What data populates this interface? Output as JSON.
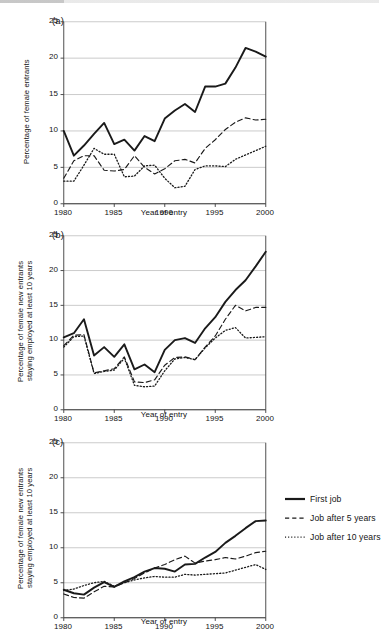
{
  "figure": {
    "panels": [
      {
        "tag": "(a)",
        "ylabel": "Percentage of female entrants",
        "xlabel": "Year of entry",
        "yticks": [
          "0",
          "5",
          "10",
          "15",
          "20",
          "25"
        ],
        "xticks": [
          "1980",
          "1985",
          "1990",
          "1995",
          "2000"
        ]
      },
      {
        "tag": "(b)",
        "ylabel": "Percentage of female new entrants\nstaying employed at least 10 years",
        "xlabel": "Year of entry",
        "yticks": [
          "0",
          "5",
          "10",
          "15",
          "20",
          "25"
        ],
        "xticks": [
          "1980",
          "1985",
          "1990",
          "1995",
          "2000"
        ]
      },
      {
        "tag": "(c)",
        "ylabel": "Percentage of female new entrants\nstaying employed at least 10 years",
        "xlabel": "Year of entry",
        "yticks": [
          "0",
          "5",
          "10",
          "15",
          "20",
          "25"
        ],
        "xticks": [
          "1980",
          "1985",
          "1990",
          "1995",
          "2000"
        ]
      }
    ],
    "legend": {
      "items": [
        {
          "label": "First job",
          "style": "solid"
        },
        {
          "label": "Job after 5 years",
          "style": "dashed"
        },
        {
          "label": "Job after 10 years",
          "style": "dotted"
        }
      ]
    },
    "colors": {
      "line": "#1a1a1a",
      "grid": "#b9b9b9",
      "axis": "#3c3c3c",
      "background": "#ffffff"
    }
  },
  "chart_data": [
    {
      "type": "line",
      "panel": "(a)",
      "title": "",
      "xlabel": "Year of entry",
      "ylabel": "Percentage of female entrants",
      "xlim": [
        1980,
        2000
      ],
      "ylim": [
        0,
        25
      ],
      "yticks": [
        0,
        5,
        10,
        15,
        20,
        25
      ],
      "xticks": [
        1980,
        1985,
        1990,
        1995,
        2000
      ],
      "grid": "horizontal",
      "legend_position": "external-right",
      "x": [
        1980,
        1981,
        1982,
        1983,
        1984,
        1985,
        1986,
        1987,
        1988,
        1989,
        1990,
        1991,
        1992,
        1993,
        1994,
        1995,
        1996,
        1997,
        1998,
        1999,
        2000
      ],
      "series": [
        {
          "name": "First job",
          "style": "solid",
          "values": [
            10.0,
            6.6,
            8.0,
            9.6,
            11.1,
            8.2,
            8.8,
            7.3,
            9.3,
            8.6,
            11.7,
            12.8,
            13.7,
            12.6,
            16.1,
            16.1,
            16.5,
            18.7,
            21.4,
            20.9,
            20.2
          ]
        },
        {
          "name": "Job after 5 years",
          "style": "dashed",
          "values": [
            3.5,
            5.9,
            6.6,
            6.6,
            4.6,
            4.5,
            4.7,
            6.6,
            5.0,
            4.1,
            4.8,
            5.9,
            6.1,
            5.6,
            7.6,
            8.8,
            10.2,
            11.2,
            11.8,
            11.5,
            11.6
          ]
        },
        {
          "name": "Job after 10 years",
          "style": "dotted",
          "values": [
            3.1,
            3.1,
            5.3,
            7.6,
            6.8,
            6.8,
            3.7,
            3.8,
            5.2,
            5.3,
            3.5,
            2.2,
            2.4,
            4.7,
            5.2,
            5.2,
            5.1,
            6.1,
            6.7,
            7.3,
            7.9
          ]
        }
      ]
    },
    {
      "type": "line",
      "panel": "(b)",
      "title": "",
      "xlabel": "Year of entry",
      "ylabel": "Percentage of female new entrants staying employed at least 10 years",
      "xlim": [
        1980,
        2000
      ],
      "ylim": [
        0,
        25
      ],
      "yticks": [
        0,
        5,
        10,
        15,
        20,
        25
      ],
      "xticks": [
        1980,
        1985,
        1990,
        1995,
        2000
      ],
      "grid": "horizontal",
      "legend_position": "external-right",
      "x": [
        1980,
        1981,
        1982,
        1983,
        1984,
        1985,
        1986,
        1987,
        1988,
        1989,
        1990,
        1991,
        1992,
        1993,
        1994,
        1995,
        1996,
        1997,
        1998,
        1999,
        2000
      ],
      "series": [
        {
          "name": "First job",
          "style": "solid",
          "values": [
            10.4,
            11.0,
            13.0,
            7.8,
            9.0,
            7.6,
            9.4,
            5.8,
            6.5,
            5.4,
            8.6,
            10.0,
            10.3,
            9.6,
            11.7,
            13.3,
            15.5,
            17.2,
            18.6,
            20.6,
            22.7
          ]
        },
        {
          "name": "Job after 5 years",
          "style": "dashed",
          "values": [
            9.2,
            10.7,
            10.8,
            5.3,
            5.6,
            5.9,
            7.6,
            4.0,
            3.9,
            4.3,
            6.4,
            7.5,
            7.6,
            7.2,
            9.0,
            10.6,
            13.0,
            15.0,
            14.2,
            14.7,
            14.7
          ]
        },
        {
          "name": "Job after 10 years",
          "style": "dotted",
          "values": [
            9.0,
            10.5,
            10.6,
            5.2,
            5.5,
            5.7,
            7.4,
            3.5,
            3.3,
            3.4,
            5.6,
            7.3,
            7.5,
            7.2,
            8.9,
            10.3,
            11.4,
            11.8,
            10.3,
            10.4,
            10.5
          ]
        }
      ]
    },
    {
      "type": "line",
      "panel": "(c)",
      "title": "",
      "xlabel": "Year of entry",
      "ylabel": "Percentage of female new entrants staying employed at least 10 years",
      "xlim": [
        1980,
        2000
      ],
      "ylim": [
        0,
        25
      ],
      "yticks": [
        0,
        5,
        10,
        15,
        20,
        25
      ],
      "xticks": [
        1980,
        1985,
        1990,
        1995,
        2000
      ],
      "grid": "horizontal",
      "legend_position": "external-right",
      "x": [
        1980,
        1981,
        1982,
        1983,
        1984,
        1985,
        1986,
        1987,
        1988,
        1989,
        1990,
        1991,
        1992,
        1993,
        1994,
        1995,
        1996,
        1997,
        1998,
        1999,
        2000
      ],
      "series": [
        {
          "name": "First job",
          "style": "solid",
          "values": [
            4.0,
            3.5,
            3.3,
            4.3,
            5.1,
            4.4,
            5.2,
            5.8,
            6.6,
            7.1,
            7.0,
            6.6,
            7.6,
            7.7,
            8.6,
            9.4,
            10.7,
            11.7,
            12.8,
            13.8,
            13.9
          ]
        },
        {
          "name": "Job after 5 years",
          "style": "dashed",
          "values": [
            3.4,
            2.9,
            2.8,
            3.7,
            4.5,
            4.4,
            5.0,
            5.6,
            6.4,
            7.1,
            7.6,
            8.3,
            8.8,
            7.8,
            8.1,
            8.3,
            8.6,
            8.4,
            8.8,
            9.3,
            9.5
          ]
        },
        {
          "name": "Job after 10 years",
          "style": "dotted",
          "values": [
            3.9,
            4.1,
            4.6,
            5.0,
            5.2,
            4.5,
            5.0,
            5.4,
            5.7,
            5.9,
            5.8,
            5.8,
            6.2,
            6.1,
            6.2,
            6.3,
            6.4,
            6.8,
            7.2,
            7.6,
            6.9
          ]
        }
      ]
    }
  ]
}
